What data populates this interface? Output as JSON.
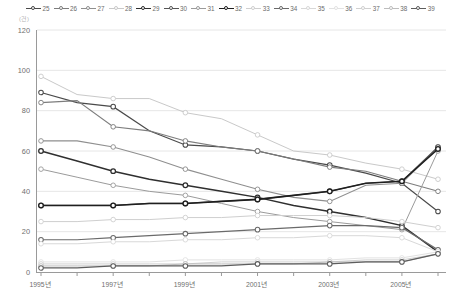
{
  "unit_label": "(건)",
  "chart_data": {
    "type": "line",
    "title": "",
    "xlabel": "",
    "ylabel": "",
    "ylim": [
      0,
      120
    ],
    "yticks": [
      0,
      20,
      40,
      60,
      80,
      100,
      120
    ],
    "grid": true,
    "legend_position": "top",
    "x": [
      1995,
      1996,
      1997,
      1998,
      1999,
      2000,
      2001,
      2002,
      2003,
      2004,
      2005,
      2006
    ],
    "xtick_labels": [
      "1995년",
      "1997년",
      "1999년",
      "2001년",
      "2003년",
      "2005년"
    ],
    "xtick_values": [
      1995,
      1997,
      1999,
      2001,
      2003,
      2005
    ],
    "series": [
      {
        "name": "25",
        "color": "#4a4a4a",
        "width": 1.2,
        "values": [
          89,
          84,
          82,
          70,
          63,
          62,
          60,
          56,
          53,
          49,
          44,
          30
        ]
      },
      {
        "name": "26",
        "color": "#7d7d7d",
        "width": 1.1,
        "values": [
          84,
          85,
          72,
          70,
          65,
          62,
          60,
          56,
          52,
          50,
          45,
          40
        ]
      },
      {
        "name": "27",
        "color": "#8f8f8f",
        "width": 1.1,
        "values": [
          65,
          65,
          62,
          57,
          51,
          46,
          41,
          37,
          35,
          43,
          44,
          62
        ]
      },
      {
        "name": "28",
        "color": "#c9c9c9",
        "width": 1.0,
        "values": [
          97,
          88,
          86,
          86,
          79,
          76,
          68,
          60,
          58,
          54,
          51,
          46
        ]
      },
      {
        "name": "29",
        "color": "#2f2f2f",
        "width": 1.5,
        "values": [
          60,
          55,
          50,
          46,
          43,
          40,
          37,
          33,
          30,
          27,
          23,
          10
        ]
      },
      {
        "name": "30",
        "color": "#555555",
        "width": 1.2,
        "values": [
          33,
          33,
          33,
          34,
          34,
          35,
          36,
          38,
          40,
          44,
          45,
          62
        ]
      },
      {
        "name": "31",
        "color": "#9b9b9b",
        "width": 1.0,
        "values": [
          51,
          47,
          43,
          40,
          38,
          34,
          30,
          27,
          25,
          23,
          21,
          60
        ]
      },
      {
        "name": "32",
        "color": "#1f1f1f",
        "width": 1.6,
        "values": [
          33,
          33,
          33,
          34,
          34,
          35,
          36,
          38,
          40,
          44,
          45,
          61
        ]
      },
      {
        "name": "33",
        "color": "#cfcfcf",
        "width": 1.0,
        "values": [
          25,
          25,
          26,
          26,
          27,
          27,
          28,
          28,
          28,
          27,
          25,
          22
        ]
      },
      {
        "name": "34",
        "color": "#6a6a6a",
        "width": 1.2,
        "values": [
          16,
          16,
          17,
          18,
          19,
          20,
          21,
          22,
          23,
          23,
          22,
          11
        ]
      },
      {
        "name": "35",
        "color": "#d8d8d8",
        "width": 1.0,
        "values": [
          14,
          14,
          15,
          15,
          16,
          16,
          17,
          17,
          18,
          18,
          17,
          10
        ]
      },
      {
        "name": "36",
        "color": "#e2e2e2",
        "width": 1.0,
        "values": [
          5,
          5,
          5,
          5,
          6,
          6,
          6,
          6,
          6,
          7,
          7,
          10
        ]
      },
      {
        "name": "37",
        "color": "#d0d0d0",
        "width": 1.0,
        "values": [
          4,
          4,
          4,
          4,
          4,
          5,
          5,
          5,
          5,
          6,
          6,
          9
        ]
      },
      {
        "name": "38",
        "color": "#bdbdbd",
        "width": 1.0,
        "values": [
          3,
          3,
          3,
          3,
          4,
          4,
          4,
          4,
          5,
          5,
          5,
          9
        ]
      },
      {
        "name": "39",
        "color": "#5d5d5d",
        "width": 1.2,
        "values": [
          2,
          2,
          3,
          3,
          3,
          3,
          4,
          4,
          4,
          5,
          5,
          9
        ]
      }
    ]
  },
  "legend": {
    "items": [
      {
        "label": "25",
        "color": "#4a4a4a"
      },
      {
        "label": "26",
        "color": "#7d7d7d"
      },
      {
        "label": "27",
        "color": "#8f8f8f"
      },
      {
        "label": "28",
        "color": "#c9c9c9"
      },
      {
        "label": "29",
        "color": "#2f2f2f"
      },
      {
        "label": "30",
        "color": "#555555"
      },
      {
        "label": "31",
        "color": "#9b9b9b"
      },
      {
        "label": "32",
        "color": "#1f1f1f"
      },
      {
        "label": "33",
        "color": "#cfcfcf"
      },
      {
        "label": "34",
        "color": "#6a6a6a"
      },
      {
        "label": "35",
        "color": "#d8d8d8"
      },
      {
        "label": "36",
        "color": "#e2e2e2"
      },
      {
        "label": "37",
        "color": "#d0d0d0"
      },
      {
        "label": "38",
        "color": "#bdbdbd"
      },
      {
        "label": "39",
        "color": "#5d5d5d"
      }
    ]
  }
}
